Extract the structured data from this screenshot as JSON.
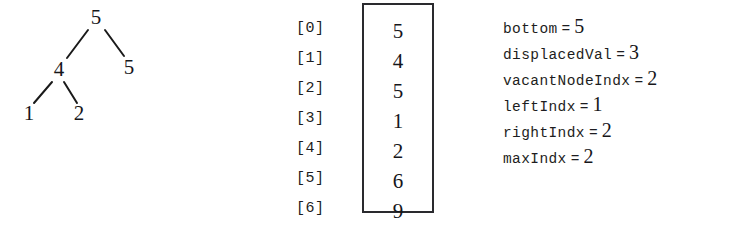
{
  "figure": {
    "background_color": "#ffffff",
    "ink_color": "#1a1a1a"
  },
  "tree": {
    "name": "binary-heap-tree",
    "nodes": [
      {
        "id": "root",
        "label": "5",
        "x": 96,
        "y": 18
      },
      {
        "id": "left",
        "label": "4",
        "x": 59,
        "y": 70
      },
      {
        "id": "right",
        "label": "5",
        "x": 129,
        "y": 68
      },
      {
        "id": "left-left",
        "label": "1",
        "x": 29,
        "y": 114
      },
      {
        "id": "left-right",
        "label": "2",
        "x": 79,
        "y": 114
      }
    ],
    "edges": [
      {
        "from": "root",
        "to": "left",
        "x1": 88,
        "y1": 30,
        "x2": 67,
        "y2": 58
      },
      {
        "from": "root",
        "to": "right",
        "x1": 105,
        "y1": 30,
        "x2": 124,
        "y2": 56
      },
      {
        "from": "left",
        "to": "left-left",
        "x1": 52,
        "y1": 82,
        "x2": 34,
        "y2": 103
      },
      {
        "from": "left",
        "to": "left-right",
        "x1": 64,
        "y1": 82,
        "x2": 77,
        "y2": 103
      }
    ]
  },
  "array": {
    "name": "heap-array",
    "box_color": "#2a2a2e",
    "rows": [
      {
        "index_label": "[0]",
        "value": "5",
        "y": 21
      },
      {
        "index_label": "[1]",
        "value": "4",
        "y": 51
      },
      {
        "index_label": "[2]",
        "value": "5",
        "y": 81
      },
      {
        "index_label": "[3]",
        "value": "1",
        "y": 111
      },
      {
        "index_label": "[4]",
        "value": "2",
        "y": 141
      },
      {
        "index_label": "[5]",
        "value": "6",
        "y": 171
      },
      {
        "index_label": "[6]",
        "value": "9",
        "y": 201
      }
    ]
  },
  "variables": {
    "name": "variable-state-list",
    "equals_sign": "=",
    "items": [
      {
        "name": "bottom",
        "value": "5"
      },
      {
        "name": "displacedVal",
        "value": "3"
      },
      {
        "name": "vacantNodeIndx",
        "value": "2"
      },
      {
        "name": "leftIndx",
        "value": "1"
      },
      {
        "name": "rightIndx",
        "value": "2"
      },
      {
        "name": "maxIndx",
        "value": "2"
      }
    ]
  }
}
